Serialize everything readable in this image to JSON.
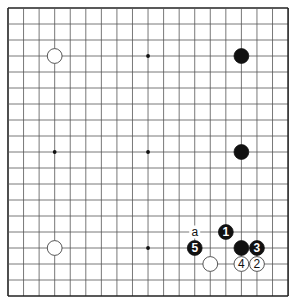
{
  "board": {
    "size": 19,
    "origin_x": 8,
    "origin_y": 8,
    "step_x": 15.56,
    "step_y": 16,
    "line_color": "#555555",
    "edge_color": "#222222",
    "background": "#ffffff"
  },
  "hoshi": [
    {
      "col": 9,
      "row": 3
    },
    {
      "col": 3,
      "row": 9
    },
    {
      "col": 9,
      "row": 9
    },
    {
      "col": 9,
      "row": 15
    }
  ],
  "stones": [
    {
      "color": "white",
      "col": 3,
      "row": 3,
      "label": ""
    },
    {
      "color": "black",
      "col": 15,
      "row": 3,
      "label": ""
    },
    {
      "color": "black",
      "col": 15,
      "row": 9,
      "label": ""
    },
    {
      "color": "white",
      "col": 3,
      "row": 15,
      "label": ""
    },
    {
      "color": "black",
      "col": 15,
      "row": 15,
      "label": ""
    },
    {
      "color": "white",
      "col": 13,
      "row": 16,
      "label": ""
    },
    {
      "color": "black",
      "col": 14,
      "row": 14,
      "label": "1"
    },
    {
      "color": "white",
      "col": 16,
      "row": 16,
      "label": "2"
    },
    {
      "color": "black",
      "col": 16,
      "row": 15,
      "label": "3"
    },
    {
      "color": "white",
      "col": 15,
      "row": 16,
      "label": "4"
    },
    {
      "color": "black",
      "col": 12,
      "row": 15,
      "label": "5"
    }
  ],
  "markers": [
    {
      "col": 12,
      "row": 14,
      "label": "a"
    }
  ]
}
